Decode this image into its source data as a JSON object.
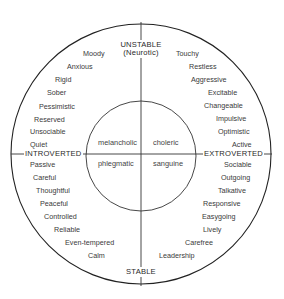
{
  "axes": {
    "top": "UNSTABLE",
    "top_sub": "(Neurotic)",
    "bottom": "STABLE",
    "left": "INTROVERTED",
    "right": "EXTROVERTED"
  },
  "temperaments": {
    "top_left": "melancholic",
    "top_right": "choleric",
    "bottom_left": "phlegmatic",
    "bottom_right": "sanguine"
  },
  "traits": {
    "unstable_introverted": [
      "Moody",
      "Anxious",
      "Rigid",
      "Sober",
      "Pessimistic",
      "Reserved",
      "Unsociable",
      "Quiet"
    ],
    "unstable_extroverted": [
      "Touchy",
      "Restless",
      "Aggressive",
      "Excitable",
      "Changeable",
      "Impulsive",
      "Optimistic",
      "Active"
    ],
    "stable_introverted": [
      "Passive",
      "Careful",
      "Thoughtful",
      "Peaceful",
      "Controlled",
      "Reliable",
      "Even-tempered",
      "Calm"
    ],
    "stable_extroverted": [
      "Sociable",
      "Outgoing",
      "Talkative",
      "Responsive",
      "Easygoing",
      "Lively",
      "Carefree",
      "Leadership"
    ]
  },
  "colors": {
    "line": "#222222",
    "text": "#3a3a3a",
    "background": "#ffffff"
  }
}
